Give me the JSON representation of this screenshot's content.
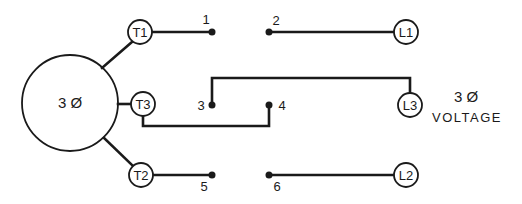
{
  "motor": {
    "label": "3 Ø"
  },
  "terminals": {
    "t1": "T1",
    "t2": "T2",
    "t3": "T3"
  },
  "lines": {
    "l1": "L1",
    "l2": "L2",
    "l3": "L3"
  },
  "contacts": [
    "1",
    "2",
    "3",
    "4",
    "5",
    "6"
  ],
  "supply": {
    "phase_label": "3 Ø",
    "voltage_label": "VOLTAGE"
  },
  "colors": {
    "ink": "#1a1a1a",
    "background": "#ffffff"
  }
}
